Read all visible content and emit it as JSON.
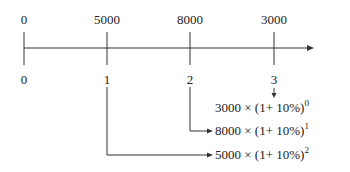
{
  "diagram": {
    "type": "cash-flow timeline",
    "cash_flows": [
      {
        "period": "0",
        "amount": "0"
      },
      {
        "period": "1",
        "amount": "5000"
      },
      {
        "period": "2",
        "amount": "8000"
      },
      {
        "period": "3",
        "amount": "3000"
      }
    ],
    "formulas": [
      {
        "base": "3000 × (1+ 10%)",
        "exp": "0"
      },
      {
        "base": "8000 × (1+ 10%)",
        "exp": "1"
      },
      {
        "base": "5000 × (1+ 10%)",
        "exp": "2"
      }
    ],
    "colors": {
      "line": "#333333",
      "text": "#222222"
    }
  }
}
